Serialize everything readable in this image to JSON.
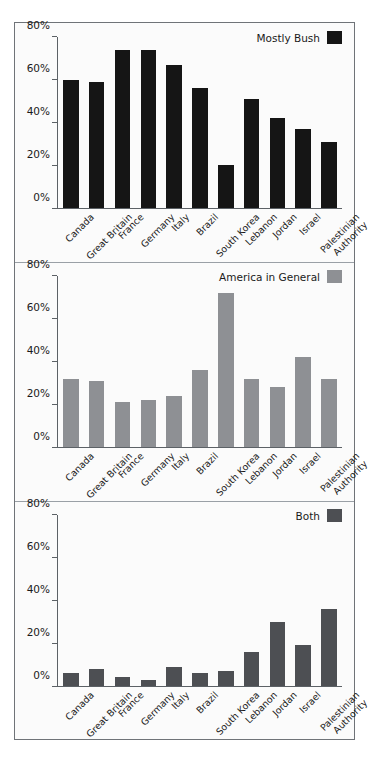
{
  "chart_data": [
    {
      "type": "bar",
      "title": "Mostly Bush",
      "legend_label": "Mostly Bush",
      "legend_position": "top-right",
      "color": "#151515",
      "xlabel": "",
      "ylabel": "",
      "ylim": [
        0,
        80
      ],
      "grid": false,
      "yticks": [
        0,
        20,
        40,
        60,
        80
      ],
      "ytick_labels": [
        "0%",
        "20%",
        "40%",
        "60%",
        "80%"
      ],
      "categories": [
        "Canada",
        "Great Britain",
        "France",
        "Germany",
        "Italy",
        "Brazil",
        "South Korea",
        "Lebanon",
        "Jordan",
        "Israel",
        "Palestinian Authority"
      ],
      "values": [
        60,
        59,
        74,
        74,
        67,
        56,
        20,
        51,
        42,
        37,
        31
      ]
    },
    {
      "type": "bar",
      "title": "America in General",
      "legend_label": "America in General",
      "legend_position": "top-right",
      "color": "#8e9094",
      "xlabel": "",
      "ylabel": "",
      "ylim": [
        0,
        80
      ],
      "grid": false,
      "yticks": [
        0,
        20,
        40,
        60,
        80
      ],
      "ytick_labels": [
        "0%",
        "20%",
        "40%",
        "60%",
        "80%"
      ],
      "categories": [
        "Canada",
        "Great Britain",
        "France",
        "Germany",
        "Italy",
        "Brazil",
        "South Korea",
        "Lebanon",
        "Jordan",
        "Israel",
        "Palestinian Authority"
      ],
      "values": [
        32,
        31,
        21,
        22,
        24,
        36,
        72,
        32,
        28,
        42,
        32
      ]
    },
    {
      "type": "bar",
      "title": "Both",
      "legend_label": "Both",
      "legend_position": "top-right",
      "color": "#4d4f53",
      "xlabel": "",
      "ylabel": "",
      "ylim": [
        0,
        80
      ],
      "grid": false,
      "yticks": [
        0,
        20,
        40,
        60,
        80
      ],
      "ytick_labels": [
        "0%",
        "20%",
        "40%",
        "60%",
        "80%"
      ],
      "categories": [
        "Canada",
        "Great Britain",
        "France",
        "Germany",
        "Italy",
        "Brazil",
        "South Korea",
        "Lebanon",
        "Jordan",
        "Israel",
        "Palestinian Authority"
      ],
      "values": [
        6,
        8,
        4,
        3,
        9,
        6,
        7,
        16,
        30,
        19,
        36
      ]
    }
  ],
  "category_label_lines": [
    [
      "Canada"
    ],
    [
      "Great Britain"
    ],
    [
      "France"
    ],
    [
      "Germany"
    ],
    [
      "Italy"
    ],
    [
      "Brazil"
    ],
    [
      "South Korea"
    ],
    [
      "Lebanon"
    ],
    [
      "Jordan"
    ],
    [
      "Israel"
    ],
    [
      "Palestinian",
      "Authority"
    ]
  ],
  "figure": {
    "background": "#fbfbfb",
    "border_color": "#6f7378",
    "panel_count": 3
  }
}
